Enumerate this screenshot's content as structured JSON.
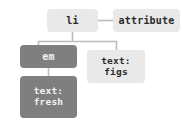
{
  "diagram": {
    "type": "dom-tree",
    "title": "",
    "colors": {
      "element_node_fill": "#e9e9e9",
      "element_node_text": "#2b2b2b",
      "highlight_node_fill": "#7f7f7f",
      "highlight_node_text": "#f2f2f2",
      "edge_color": "#bcbcbc",
      "background": "#ffffff"
    },
    "nodes": [
      {
        "id": "li",
        "label": "li",
        "style": "light"
      },
      {
        "id": "attribute",
        "label": "attribute",
        "style": "light"
      },
      {
        "id": "em",
        "label": "em",
        "style": "dark"
      },
      {
        "id": "text_figs",
        "label": "text:\nfigs",
        "style": "light"
      },
      {
        "id": "text_fresh",
        "label": "text:\nfresh",
        "style": "dark"
      }
    ],
    "edges": [
      {
        "from": "li",
        "to": "attribute",
        "kind": "horizontal"
      },
      {
        "from": "li",
        "to": "em",
        "kind": "elbow"
      },
      {
        "from": "li",
        "to": "text_figs",
        "kind": "elbow"
      },
      {
        "from": "em",
        "to": "text_fresh",
        "kind": "vertical"
      }
    ]
  }
}
